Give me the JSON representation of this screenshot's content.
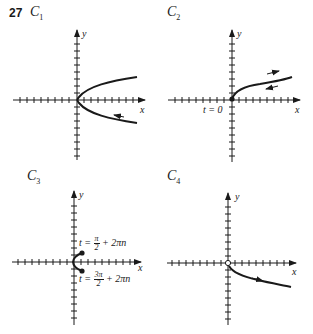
{
  "problem_number": "27",
  "panels": [
    {
      "id": "C1",
      "letter": "C",
      "sub": "1",
      "x_label": "x",
      "y_label": "y",
      "description": "Sideways parabola opening right with vertex at origin; arrow on lower branch pointing toward origin"
    },
    {
      "id": "C2",
      "letter": "C",
      "sub": "2",
      "x_label": "x",
      "y_label": "y",
      "annotation": "t = 0",
      "description": "Upper half of sideways parabola starting at filled dot at origin; arrows indicate back-and-forth traversal"
    },
    {
      "id": "C3",
      "letter": "C",
      "sub": "3",
      "x_label": "x",
      "y_label": "y",
      "annotation_top": {
        "prefix": "t = ",
        "num": "π",
        "den": "2",
        "suffix": " + 2πn"
      },
      "annotation_bottom": {
        "prefix": "t = ",
        "num": "3π",
        "den": "2",
        "suffix": " + 2πn"
      },
      "description": "Small arc near origin between two filled endpoints"
    },
    {
      "id": "C4",
      "letter": "C",
      "sub": "4",
      "x_label": "x",
      "y_label": "y",
      "description": "Lower half of sideways parabola starting at open circle at origin; arrow pointing away from origin"
    }
  ]
}
